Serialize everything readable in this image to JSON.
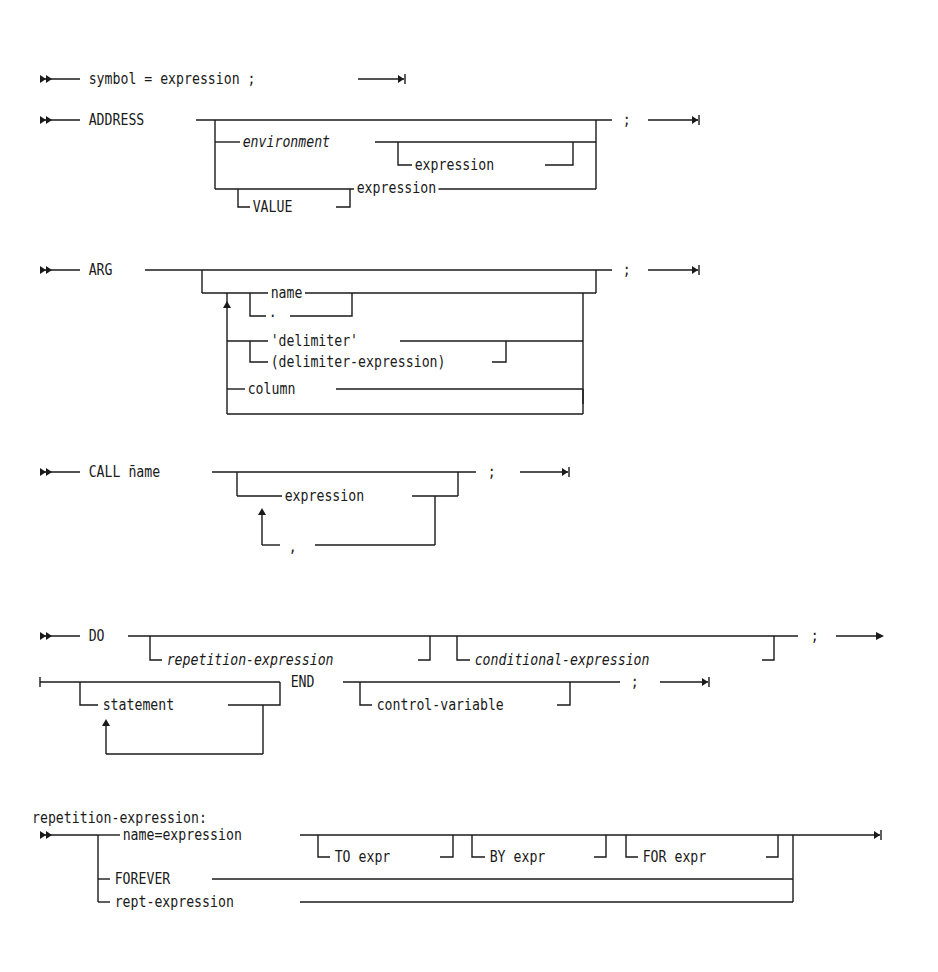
{
  "diagrams": {
    "assignment": {
      "parts": [
        "symbol = expression ;"
      ]
    },
    "address": {
      "keyword": "ADDRESS",
      "environment": "environment",
      "env_expression": "expression",
      "value": "VALUE",
      "value_expression": "expression",
      "terminator": ";"
    },
    "arg": {
      "keyword": "ARG",
      "name": "name",
      "dot": ".",
      "delimiter": "'delimiter'",
      "delimiter_expression": "(delimiter-expression)",
      "column": "column",
      "terminator": ";"
    },
    "call": {
      "keyword": "CALL n̄ame",
      "expression": "expression",
      "separator": ",",
      "terminator": ";"
    },
    "do": {
      "keyword": "DO",
      "repetition": "repetition-expression",
      "conditional": "conditional-expression",
      "terminator1": ";",
      "statement": "statement",
      "end": "END",
      "control_variable": "control-variable",
      "terminator2": ";"
    },
    "repetition_expression": {
      "heading": "repetition-expression:",
      "name_expr": "name=expression",
      "to": "TO expr",
      "by": "BY expr",
      "for": "FOR expr",
      "forever": "FOREVER",
      "rept": "rept-expression"
    }
  },
  "icons": {
    "start": "double-arrow-start",
    "end": "arrow-to-bar-end",
    "continue": "arrow-continue"
  }
}
